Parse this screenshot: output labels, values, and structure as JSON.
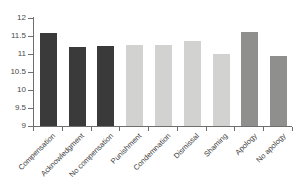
{
  "chart_data": {
    "type": "bar",
    "title": "",
    "subtitle": "",
    "xlabel": "",
    "ylabel": "",
    "ylim": [
      9,
      12
    ],
    "ytick_labels": [
      "12",
      "11.5",
      "11",
      "10.5",
      "10",
      "9.5",
      "9"
    ],
    "ytick_values": [
      12,
      11.5,
      11,
      10.5,
      10,
      9.5,
      9
    ],
    "grid": false,
    "legend": "none",
    "categories": [
      "Compensation",
      "Acknowledgment",
      "No compensation",
      "Punishment",
      "Condemnation",
      "Dismissal",
      "Shaming",
      "Apology",
      "No apology"
    ],
    "values": [
      11.57,
      11.2,
      11.22,
      11.25,
      11.25,
      11.35,
      11.0,
      11.6,
      10.95
    ],
    "bar_colors": [
      "#3a3a3a",
      "#3a3a3a",
      "#3a3a3a",
      "#d2d2d0",
      "#d2d2d0",
      "#d2d2d0",
      "#d2d2d0",
      "#8f8f8d",
      "#8f8f8d"
    ],
    "series": [
      {
        "name": "value",
        "values": [
          11.57,
          11.2,
          11.22,
          11.25,
          11.25,
          11.35,
          11.0,
          11.6,
          10.95
        ]
      }
    ],
    "axis_color": "#6e6e6e",
    "background": "#ffffff"
  }
}
